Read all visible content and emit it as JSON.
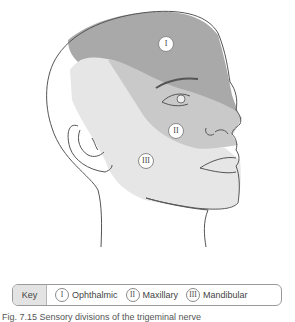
{
  "figure": {
    "regions": [
      {
        "id": "I",
        "label": "I",
        "name": "Ophthalmic",
        "color": "#a9a9a9"
      },
      {
        "id": "II",
        "label": "II",
        "name": "Maxillary",
        "color": "#c9c9c9"
      },
      {
        "id": "III",
        "label": "III",
        "name": "Mandibular",
        "color": "#e6e6e6"
      }
    ]
  },
  "key": {
    "title": "Key",
    "items": [
      {
        "badge": "I",
        "label": "Ophthalmic"
      },
      {
        "badge": "II",
        "label": "Maxillary"
      },
      {
        "badge": "III",
        "label": "Mandibular"
      }
    ]
  },
  "caption": {
    "text": "Fig. 7.15 Sensory divisions of the trigeminal nerve"
  }
}
